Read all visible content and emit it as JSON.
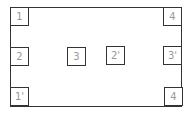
{
  "diagram": {
    "boxes": [
      {
        "id": "tl",
        "label": "1"
      },
      {
        "id": "ml",
        "label": "2"
      },
      {
        "id": "bl",
        "label": "1'"
      },
      {
        "id": "c1",
        "label": "3"
      },
      {
        "id": "c2",
        "label": "2'"
      },
      {
        "id": "tr",
        "label": "4"
      },
      {
        "id": "mr",
        "label": "3'"
      },
      {
        "id": "br",
        "label": "4"
      }
    ]
  }
}
